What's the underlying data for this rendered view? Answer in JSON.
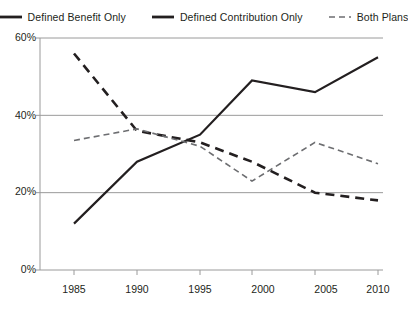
{
  "legend": {
    "position": "top-center",
    "entries": [
      {
        "label": "Defined Benefit Only",
        "style": "solid-bold-dashed",
        "icon": "line-dashed-bold-icon"
      },
      {
        "label": "Defined Contribution Only",
        "style": "solid",
        "icon": "line-solid-icon"
      },
      {
        "label": "Both Plans",
        "style": "dashed",
        "icon": "line-dashed-icon"
      }
    ]
  },
  "axes": {
    "y_ticks": [
      "0%",
      "20%",
      "40%",
      "60%"
    ],
    "x_ticks": [
      "1985",
      "1990",
      "1995",
      "2000",
      "2005",
      "2010"
    ]
  },
  "chart_data": {
    "type": "line",
    "title": "",
    "xlabel": "",
    "ylabel": "",
    "categories": [
      1985,
      1990,
      1995,
      2000,
      2005,
      2010
    ],
    "x": [
      1985,
      1990,
      1995,
      2000,
      2005,
      2010
    ],
    "ylim": [
      0,
      60
    ],
    "xlim": [
      1983,
      2012
    ],
    "yticks": [
      0,
      20,
      40,
      60
    ],
    "ytick_labels": [
      "0%",
      "20%",
      "40%",
      "60%"
    ],
    "xticks": [
      1985,
      1990,
      1995,
      2000,
      2005,
      2010
    ],
    "grid": "horizontal",
    "legend_position": "top-center",
    "units": "percent",
    "series": [
      {
        "name": "Defined Benefit Only",
        "values": [
          56,
          36,
          33,
          28,
          20,
          18
        ],
        "line_style": "dashed",
        "line_width": 2.6,
        "color": "#231f20"
      },
      {
        "name": "Defined Contribution Only",
        "values": [
          12,
          28,
          35,
          49,
          46,
          55
        ],
        "line_style": "solid",
        "line_width": 2.2,
        "color": "#231f20"
      },
      {
        "name": "Both Plans",
        "values": [
          33.5,
          36.5,
          32,
          23,
          33,
          27.5
        ],
        "line_style": "dashed",
        "line_width": 1.6,
        "color": "#6d6e71"
      }
    ]
  }
}
